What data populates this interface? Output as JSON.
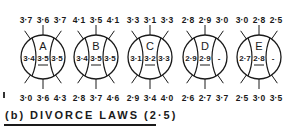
{
  "figure": {
    "title": "(b) DIVORCE LAWS (2·5)",
    "colors": {
      "ink": "#1a1a1a",
      "background": "#ffffff"
    }
  },
  "diagram": {
    "type": "circle-glyphs",
    "circles": [
      {
        "id": "A",
        "top": [
          "3·7",
          "3·6",
          "3·7"
        ],
        "left": "3·4",
        "center": "3·5",
        "right": "3·5",
        "bottom": [
          "3·0",
          "3·6",
          "4·3"
        ]
      },
      {
        "id": "B",
        "top": [
          "4·1",
          "3·5",
          "4·1"
        ],
        "left": "3·4",
        "center": "3·5",
        "right": "3·5",
        "bottom": [
          "2·8",
          "3·7",
          "4·6"
        ]
      },
      {
        "id": "C",
        "top": [
          "3·3",
          "3·1",
          "3·3"
        ],
        "left": "3·1",
        "center": "3·2",
        "right": "3·3",
        "bottom": [
          "2·9",
          "3·4",
          "4·0"
        ]
      },
      {
        "id": "D",
        "top": [
          "2·8",
          "2·9",
          "3·0"
        ],
        "left": "2·9",
        "center": "2·9",
        "right": "-",
        "bottom": [
          "2·6",
          "2·7",
          "3·7"
        ]
      },
      {
        "id": "E",
        "top": [
          "3·0",
          "2·8",
          "2·5"
        ],
        "left": "2·7",
        "center": "2·8",
        "right": "-",
        "bottom": [
          "2·5",
          "3·0",
          "3·5"
        ]
      }
    ]
  }
}
